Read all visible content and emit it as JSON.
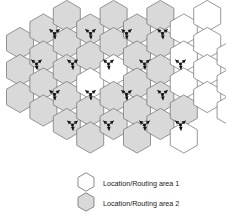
{
  "figure": {
    "type": "hexagonal-cellular-network-diagram",
    "colors": {
      "area1_fill": "#ffffff",
      "area2_fill": "#d9d9d9",
      "cell_border": "#6b6b6b",
      "antenna": "#111111",
      "legend_text": "#1a1a1a"
    },
    "geometry": {
      "hex_radius": 15.6,
      "origin_x": 20.0,
      "origin_y": 16.0,
      "col_step": 23.4,
      "row_step": 27.0
    },
    "cells": [
      {
        "col": 0,
        "row": 1,
        "area": 2
      },
      {
        "col": 0,
        "row": 2,
        "area": 2
      },
      {
        "col": 0,
        "row": 3,
        "area": 2
      },
      {
        "col": 1,
        "row": 0,
        "area": 2
      },
      {
        "col": 1,
        "row": 1,
        "area": 2
      },
      {
        "col": 1,
        "row": 2,
        "area": 2
      },
      {
        "col": 1,
        "row": 3,
        "area": 2
      },
      {
        "col": 2,
        "row": 0,
        "area": 2
      },
      {
        "col": 2,
        "row": 1,
        "area": 2
      },
      {
        "col": 2,
        "row": 2,
        "area": 2
      },
      {
        "col": 2,
        "row": 3,
        "area": 2
      },
      {
        "col": 2,
        "row": 4,
        "area": 2
      },
      {
        "col": 3,
        "row": 0,
        "area": 2
      },
      {
        "col": 3,
        "row": 1,
        "area": 2
      },
      {
        "col": 3,
        "row": 2,
        "area": 1
      },
      {
        "col": 3,
        "row": 3,
        "area": 2
      },
      {
        "col": 3,
        "row": 4,
        "area": 2
      },
      {
        "col": 4,
        "row": 0,
        "area": 2
      },
      {
        "col": 4,
        "row": 1,
        "area": 2
      },
      {
        "col": 4,
        "row": 2,
        "area": 1
      },
      {
        "col": 4,
        "row": 3,
        "area": 2
      },
      {
        "col": 4,
        "row": 4,
        "area": 2
      },
      {
        "col": 5,
        "row": 0,
        "area": 2
      },
      {
        "col": 5,
        "row": 1,
        "area": 2
      },
      {
        "col": 5,
        "row": 2,
        "area": 2
      },
      {
        "col": 5,
        "row": 3,
        "area": 2
      },
      {
        "col": 5,
        "row": 4,
        "area": 2
      },
      {
        "col": 6,
        "row": 0,
        "area": 2
      },
      {
        "col": 6,
        "row": 1,
        "area": 2
      },
      {
        "col": 6,
        "row": 2,
        "area": 2
      },
      {
        "col": 6,
        "row": 3,
        "area": 2
      },
      {
        "col": 6,
        "row": 4,
        "area": 2
      },
      {
        "col": 7,
        "row": 0,
        "area": 1
      },
      {
        "col": 7,
        "row": 1,
        "area": 1
      },
      {
        "col": 7,
        "row": 2,
        "area": 1
      },
      {
        "col": 7,
        "row": 3,
        "area": 2
      },
      {
        "col": 7,
        "row": 4,
        "area": 1
      },
      {
        "col": 8,
        "row": 0,
        "area": 1
      },
      {
        "col": 8,
        "row": 1,
        "area": 1
      },
      {
        "col": 8,
        "row": 2,
        "area": 1
      },
      {
        "col": 8,
        "row": 3,
        "area": 1
      },
      {
        "col": 9,
        "row": 1,
        "area": 1
      },
      {
        "col": 9,
        "row": 2,
        "area": 1
      },
      {
        "col": 9,
        "row": 3,
        "area": 1
      }
    ],
    "antennas": [
      {
        "x": 54.5,
        "y": 33.5
      },
      {
        "x": 90.5,
        "y": 33.5
      },
      {
        "x": 126.5,
        "y": 33.5
      },
      {
        "x": 162.5,
        "y": 33.5
      },
      {
        "x": 36.5,
        "y": 64.0
      },
      {
        "x": 72.5,
        "y": 64.0
      },
      {
        "x": 108.5,
        "y": 64.0
      },
      {
        "x": 144.5,
        "y": 64.0
      },
      {
        "x": 180.5,
        "y": 64.0
      },
      {
        "x": 54.5,
        "y": 94.5
      },
      {
        "x": 90.5,
        "y": 94.5
      },
      {
        "x": 126.5,
        "y": 94.5
      },
      {
        "x": 162.5,
        "y": 94.5
      },
      {
        "x": 72.5,
        "y": 125.0
      },
      {
        "x": 108.5,
        "y": 125.0
      },
      {
        "x": 144.5,
        "y": 125.0
      },
      {
        "x": 180.5,
        "y": 125.0
      }
    ]
  },
  "legend": {
    "items": [
      {
        "swatch": "white-hexagon",
        "label": "Location/Routing area 1",
        "area": 1
      },
      {
        "swatch": "gray-hexagon",
        "label": "Location/Routing area 2",
        "area": 2
      }
    ]
  }
}
